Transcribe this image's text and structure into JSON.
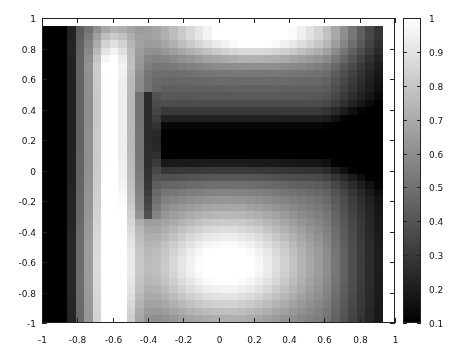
{
  "chart_data": {
    "type": "heatmap",
    "title": "",
    "xlabel": "",
    "ylabel": "",
    "xlim": [
      -1,
      1
    ],
    "ylim": [
      -1,
      1
    ],
    "x_ticks": [
      "-1",
      "-0.8",
      "-0.6",
      "-0.4",
      "-0.2",
      "0",
      "0.2",
      "0.4",
      "0.6",
      "0.8",
      "1"
    ],
    "y_ticks": [
      "1",
      "0.8",
      "0.6",
      "0.4",
      "0.2",
      "0",
      "-0.2",
      "-0.4",
      "-0.6",
      "-0.8",
      "-1"
    ],
    "colorbar": {
      "min": 0.1,
      "max": 1,
      "ticks": [
        "1",
        "0.9",
        "0.8",
        "0.7",
        "0.6",
        "0.5",
        "0.4",
        "0.3",
        "0.2",
        "0.1"
      ],
      "colormap": "grayscale",
      "low_color": "#000000",
      "high_color": "#ffffff"
    },
    "grid": false,
    "data_extent": {
      "x": [
        -1,
        0.93
      ],
      "y": [
        -1,
        0.95
      ]
    },
    "grid_resolution": 40,
    "features": [
      {
        "name": "left-dark-strip",
        "x": [
          -1,
          -0.85
        ],
        "y": [
          -1,
          0.95
        ],
        "value": 0.15
      },
      {
        "name": "left-bright-band",
        "center_x": -0.6,
        "width": 0.22,
        "y": [
          -1,
          0.7
        ],
        "value": 1.0
      },
      {
        "name": "dark-vertical-stripe",
        "center_x": -0.38,
        "y": [
          -0.25,
          0.45
        ],
        "value": 0.3
      },
      {
        "name": "top-bright-region",
        "center_x": 0.2,
        "center_y": 0.9,
        "value": 1.0
      },
      {
        "name": "dark-horizontal-band",
        "x": [
          -0.35,
          0.93
        ],
        "y": [
          -0.1,
          0.45
        ],
        "value": 0.15
      },
      {
        "name": "bottom-bright-blob",
        "center_x": 0.1,
        "center_y": -0.6,
        "value": 1.0
      },
      {
        "name": "right-dark-edge",
        "x": [
          0.8,
          0.93
        ],
        "value": 0.25
      }
    ]
  }
}
